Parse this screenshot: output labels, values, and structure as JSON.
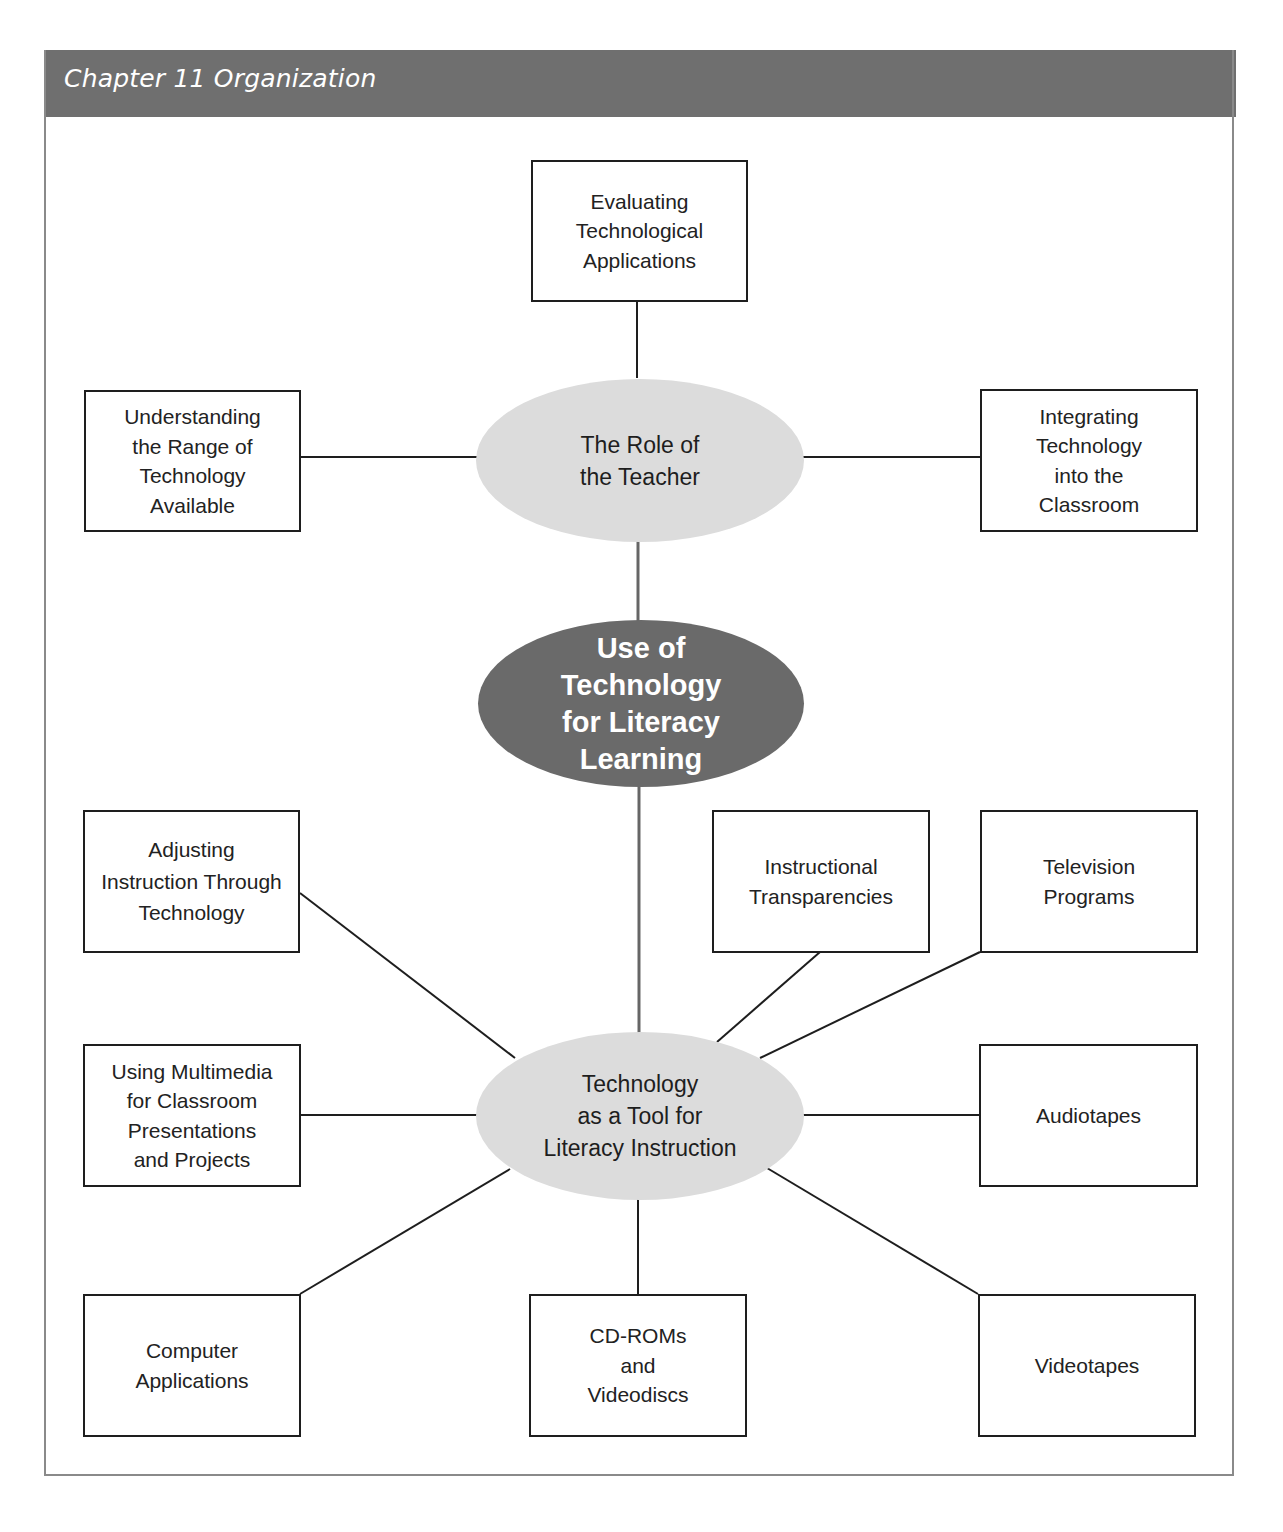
{
  "header": {
    "title": "Chapter 11 Organization"
  },
  "colors": {
    "header_bg": "#6f6f6f",
    "center_ellipse": "#6a6a6a",
    "sub_ellipse": "#dcdcdc",
    "frame_border": "#8a8a8a"
  },
  "center": {
    "label": "Use of\nTechnology\nfor Literacy\nLearning"
  },
  "hubs": {
    "teacher": {
      "label": "The Role of\nthe Teacher"
    },
    "tool": {
      "label": "Technology\nas a Tool for\nLiteracy Instruction"
    }
  },
  "teacher_children": [
    {
      "label": "Evaluating\nTechnological\nApplications"
    },
    {
      "label": "Understanding\nthe Range of\nTechnology\nAvailable"
    },
    {
      "label": "Integrating\nTechnology\ninto the\nClassroom"
    }
  ],
  "tool_children": [
    {
      "label": "Adjusting\nInstruction Through\nTechnology"
    },
    {
      "label": "Instructional\nTransparencies"
    },
    {
      "label": "Television\nPrograms"
    },
    {
      "label": "Using Multimedia\nfor Classroom\nPresentations\nand Projects"
    },
    {
      "label": "Audiotapes"
    },
    {
      "label": "Computer\nApplications"
    },
    {
      "label": "CD-ROMs\nand\nVideodiscs"
    },
    {
      "label": "Videotapes"
    }
  ]
}
